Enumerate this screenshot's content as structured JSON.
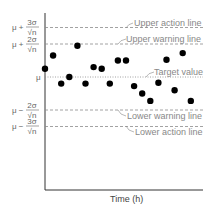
{
  "chart_data": {
    "type": "scatter",
    "title": "",
    "xlabel": "Time (h)",
    "ylabel": "",
    "unit_note": "y values expressed in units of σ/√n relative to target μ",
    "y_ticks": [
      {
        "value": 3,
        "label_prefix": "μ + ",
        "numerator": "3σ",
        "denominator": "√n"
      },
      {
        "value": 2,
        "label_prefix": "μ + ",
        "numerator": "2σ",
        "denominator": "√n"
      },
      {
        "value": 0,
        "label_prefix": "μ",
        "numerator": "",
        "denominator": ""
      },
      {
        "value": -2,
        "label_prefix": "μ − ",
        "numerator": "2σ",
        "denominator": "√n"
      },
      {
        "value": -3,
        "label_prefix": "μ − ",
        "numerator": "3σ",
        "denominator": "√n"
      }
    ],
    "reference_lines": [
      {
        "name": "Upper action line",
        "value": 3,
        "style": "dashed"
      },
      {
        "name": "Upper warning line",
        "value": 2,
        "style": "dashed"
      },
      {
        "name": "Target value",
        "value": 0,
        "style": "dotted"
      },
      {
        "name": "Lower warning line",
        "value": -2,
        "style": "dashed"
      },
      {
        "name": "Lower action line",
        "value": -3,
        "style": "dashed"
      }
    ],
    "x": [
      0,
      1,
      2,
      3,
      4,
      5,
      6,
      7,
      8,
      9,
      10,
      11,
      12,
      13,
      14,
      15,
      16,
      17,
      18
    ],
    "values": [
      0.5,
      1.3,
      -0.4,
      0.0,
      1.9,
      -0.4,
      0.6,
      0.5,
      -0.4,
      1.0,
      1.0,
      -0.55,
      -1.0,
      -1.45,
      -0.35,
      1.05,
      -0.8,
      1.45,
      -1.45
    ],
    "ylim": [
      -6.9,
      3.9
    ],
    "grid": false,
    "legend": "none",
    "annotations": [
      "Upper action line",
      "Upper warning line",
      "Target value",
      "Lower warning line",
      "Lower action line"
    ]
  },
  "labels": {
    "upper_action": "Upper action line",
    "upper_warning": "Upper warning line",
    "target": "Target value",
    "lower_warning": "Lower warning line",
    "lower_action": "Lower action line",
    "x_axis": "Time (h)",
    "mu": "μ",
    "plus3_prefix": "μ + ",
    "plus2_prefix": "μ + ",
    "minus2_prefix": "μ − ",
    "minus3_prefix": "μ − ",
    "num3": "3σ",
    "num2": "2σ",
    "den": "√n"
  },
  "colors": {
    "axis": "#333333",
    "reference_line": "#8a8a8a",
    "label": "#888888",
    "point": "#000000"
  }
}
